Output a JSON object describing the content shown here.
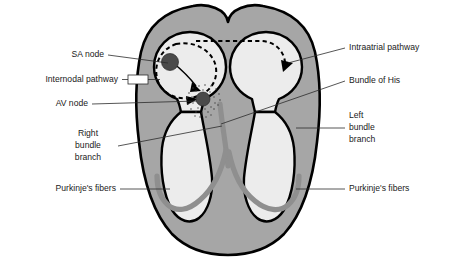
{
  "figure": {
    "background_color": "#ffffff"
  },
  "colors": {
    "myocardium_gray": "#a6a6a6",
    "chamber_fill": "#ececec",
    "conduction_gray": "#8f8f8f",
    "node_fill": "#4a4a4a",
    "outline_black": "#000000",
    "label_text": "#1a1a1a",
    "leader_line": "#2b2b2b"
  },
  "labels": {
    "left": [
      {
        "id": "sa-node",
        "text": "SA node"
      },
      {
        "id": "internodal-pathway",
        "text": "Internodal pathway"
      },
      {
        "id": "av-node",
        "text": "AV node"
      },
      {
        "id": "right-bundle-branch-line1",
        "text": "Right"
      },
      {
        "id": "right-bundle-branch-line2",
        "text": "bundle"
      },
      {
        "id": "right-bundle-branch-line3",
        "text": "branch"
      },
      {
        "id": "purkinje-fibers-left",
        "text": "Purkinje's fibers"
      }
    ],
    "right": [
      {
        "id": "intraatrial-pathway",
        "text": "Intraatrial pathway"
      },
      {
        "id": "bundle-of-his",
        "text": "Bundle of His"
      },
      {
        "id": "left-bundle-branch-line1",
        "text": "Left"
      },
      {
        "id": "left-bundle-branch-line2",
        "text": "bundle"
      },
      {
        "id": "left-bundle-branch-line3",
        "text": "branch"
      },
      {
        "id": "purkinje-fibers-right",
        "text": "Purkinje's fibers"
      }
    ]
  },
  "structures": {
    "sa_node": "SA node",
    "av_node": "AV node",
    "right_atrium": "Right atrium chamber",
    "left_atrium": "Left atrium chamber",
    "right_ventricle": "Right ventricle chamber",
    "left_ventricle": "Left ventricle chamber",
    "bundle_of_his": "Bundle of His",
    "left_bundle_branch": "Left bundle branch",
    "right_bundle_branch": "Right bundle branch",
    "purkinje_fibers": "Purkinje's fibers",
    "internodal_pathway": "Internodal pathway",
    "intraatrial_pathway": "Intraatrial pathway"
  }
}
